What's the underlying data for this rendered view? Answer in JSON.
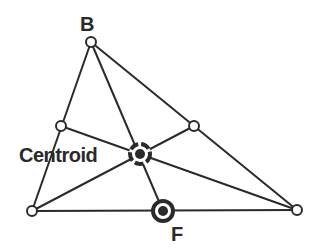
{
  "colors": {
    "stroke": "#2a2a2a",
    "fill": "#ffffff",
    "background": "#ffffff"
  },
  "points": {
    "A": {
      "x": 32,
      "y": 211
    },
    "B": {
      "x": 91,
      "y": 42
    },
    "C": {
      "x": 297,
      "y": 210
    },
    "M_AB": {
      "x": 61,
      "y": 126
    },
    "M_BC": {
      "x": 194,
      "y": 126
    },
    "F": {
      "x": 163,
      "y": 211
    },
    "Centroid": {
      "x": 140,
      "y": 154
    }
  },
  "labels": {
    "B": "B",
    "Centroid": "Centroid",
    "F": "F"
  }
}
